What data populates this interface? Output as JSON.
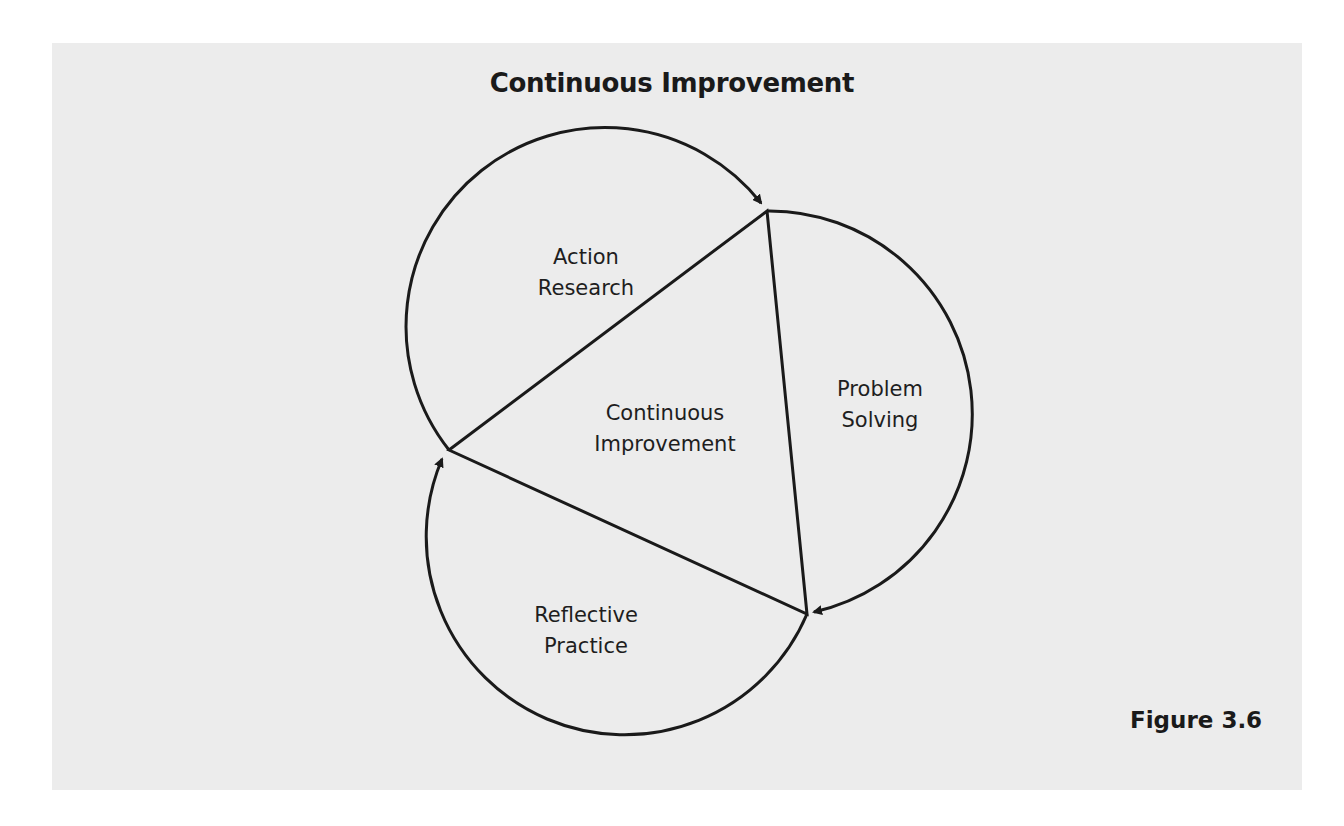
{
  "title": "Continuous Improvement",
  "center_label": "Continuous\nImprovement",
  "segments": [
    {
      "id": "action-research",
      "label": "Action\nResearch"
    },
    {
      "id": "problem-solving",
      "label": "Problem\nSolving"
    },
    {
      "id": "reflective-practice",
      "label": "Reflective\nPractice"
    }
  ],
  "figure_caption": "Figure 3.6",
  "colors": {
    "panel_background": "#ececec",
    "stroke": "#1a1a1a",
    "text": "#1e1e1e"
  }
}
